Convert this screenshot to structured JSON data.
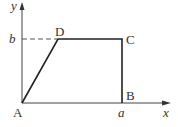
{
  "diagram": {
    "type": "geometry-figure",
    "axes": {
      "x_label": "x",
      "y_label": "y",
      "origin_label": "A"
    },
    "points": {
      "A": {
        "label": "A",
        "coords": "(0, 0)"
      },
      "B": {
        "label": "B",
        "coords": "(a, 0)"
      },
      "C": {
        "label": "C",
        "coords": "(a, b)"
      },
      "D": {
        "label": "D",
        "coords": "(d, b)"
      }
    },
    "tick_labels": {
      "x_tick": "a",
      "y_tick": "b"
    },
    "segments": [
      "A-D",
      "D-C",
      "C-B"
    ],
    "dashed": [
      "b-D"
    ],
    "colors": {
      "stroke": "#333333",
      "dashed": "#555555",
      "background": "#ffffff"
    }
  }
}
